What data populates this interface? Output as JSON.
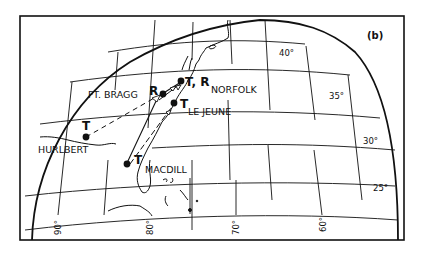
{
  "figure": {
    "panel_label": "(b)"
  },
  "map": {
    "latitude_labels": [
      "40°",
      "35°",
      "30°",
      "25°"
    ],
    "longitude_labels": [
      "90°",
      "80°",
      "70°",
      "60°"
    ],
    "sites": [
      {
        "name": "NORFOLK",
        "marker": "T, R"
      },
      {
        "name": "FT. BRAGG",
        "marker": "R"
      },
      {
        "name": "LE JEUNE",
        "marker": "T"
      },
      {
        "name": "HURLBERT",
        "marker": "T"
      },
      {
        "name": "MACDILL",
        "marker": "T"
      }
    ]
  },
  "colors": {
    "ink": "#111111",
    "background": "#ffffff"
  }
}
